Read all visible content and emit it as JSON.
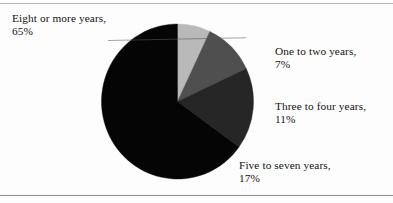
{
  "figure": {
    "name": "pie-chart-figure",
    "background": "#fdfdfd",
    "top_rule_color": "#b9b9b9",
    "bottom_rule_color": "#8e8e8e"
  },
  "labels": {
    "eight": {
      "text": "Eight or more years,",
      "pct": "65%"
    },
    "one": {
      "text": "One to two years,",
      "pct": "7%"
    },
    "three": {
      "text": "Three to four years,",
      "pct": "11%"
    },
    "five": {
      "text": "Five to seven years,",
      "pct": "17%"
    }
  },
  "cutoff_caption": "",
  "chart_data": {
    "type": "pie",
    "title": "",
    "categories": [
      "One to two years",
      "Three to four years",
      "Five to seven years",
      "Eight or more years"
    ],
    "values": [
      7,
      11,
      17,
      65
    ],
    "value_labels": [
      "7%",
      "11%",
      "17%",
      "65%"
    ],
    "units": "percent",
    "total": 100,
    "start_angle_deg": 0,
    "direction": "clockwise",
    "colors": [
      "#b9b9b9",
      "#4f4f4f",
      "#262626",
      "#050505"
    ],
    "label_placement": "outside",
    "legend": "none",
    "grid": false,
    "slices": [
      {
        "name": "One to two years",
        "value": 7,
        "label": "7%",
        "color": "#b9b9b9",
        "start_deg": 0,
        "end_deg": 25.2
      },
      {
        "name": "Three to four years",
        "value": 11,
        "label": "11%",
        "color": "#4f4f4f",
        "start_deg": 25.2,
        "end_deg": 64.8
      },
      {
        "name": "Five to seven years",
        "value": 17,
        "label": "17%",
        "color": "#262626",
        "start_deg": 64.8,
        "end_deg": 126.0
      },
      {
        "name": "Eight or more years",
        "value": 65,
        "label": "65%",
        "color": "#050505",
        "start_deg": 126.0,
        "end_deg": 360.0
      }
    ]
  }
}
